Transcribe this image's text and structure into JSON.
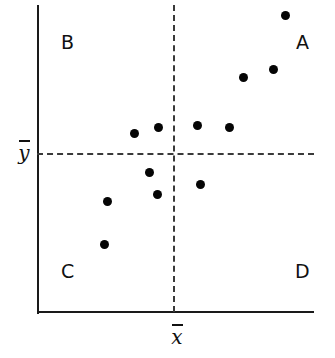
{
  "chart_data": {
    "type": "scatter",
    "title": "",
    "xlabel": "x̄",
    "ylabel": "ȳ",
    "x_mean_label": "x̄",
    "y_mean_label": "ȳ",
    "grid": false,
    "legend": false,
    "x_mean": 0.5,
    "y_mean": 0.5,
    "xlim": [
      0,
      1
    ],
    "ylim": [
      0,
      1
    ],
    "quadrants": [
      {
        "id": "A",
        "label": "A",
        "position": "upper-right"
      },
      {
        "id": "B",
        "label": "B",
        "position": "upper-left"
      },
      {
        "id": "C",
        "label": "C",
        "position": "lower-left"
      },
      {
        "id": "D",
        "label": "D",
        "position": "lower-right"
      }
    ],
    "points": [
      {
        "px": 285,
        "py": 15,
        "x": 0.896,
        "y": 0.965,
        "quadrant": "A"
      },
      {
        "px": 273,
        "py": 69,
        "x": 0.853,
        "y": 0.789,
        "quadrant": "A"
      },
      {
        "px": 243,
        "py": 77,
        "x": 0.744,
        "y": 0.763,
        "quadrant": "A"
      },
      {
        "px": 229,
        "py": 127,
        "x": 0.693,
        "y": 0.6,
        "quadrant": "A"
      },
      {
        "px": 197,
        "py": 125,
        "x": 0.578,
        "y": 0.607,
        "quadrant": "A"
      },
      {
        "px": 158,
        "py": 127,
        "x": 0.437,
        "y": 0.6,
        "quadrant": "B"
      },
      {
        "px": 134,
        "py": 133,
        "x": 0.35,
        "y": 0.581,
        "quadrant": "B"
      },
      {
        "px": 149,
        "py": 172,
        "x": 0.404,
        "y": 0.454,
        "quadrant": "C"
      },
      {
        "px": 157,
        "py": 194,
        "x": 0.433,
        "y": 0.381,
        "quadrant": "C"
      },
      {
        "px": 107,
        "py": 201,
        "x": 0.251,
        "y": 0.359,
        "quadrant": "C"
      },
      {
        "px": 104,
        "py": 244,
        "x": 0.24,
        "y": 0.219,
        "quadrant": "C"
      },
      {
        "px": 200,
        "py": 184,
        "x": 0.589,
        "y": 0.414,
        "quadrant": "D"
      }
    ]
  },
  "colors": {
    "point": "#050505",
    "axis": "#1a1a1a",
    "dashed": "#3a3a3a",
    "background": "#ffffff",
    "text": "#111111"
  }
}
